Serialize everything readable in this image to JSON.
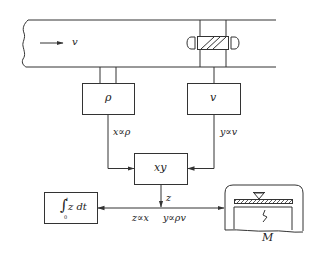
{
  "diagram": {
    "type": "block-diagram",
    "colors": {
      "line": "#333333",
      "background": "#ffffff"
    },
    "pipe": {
      "flow_label": "v"
    },
    "blocks": [
      {
        "id": "density",
        "label": "ρ"
      },
      {
        "id": "velocity",
        "label": "v"
      },
      {
        "id": "multiplier",
        "label": "xy"
      },
      {
        "id": "integrator",
        "label": "∫",
        "upper": "t",
        "lower": "0",
        "expr": "z dt"
      }
    ],
    "signals": {
      "density_out": "x∝ρ",
      "velocity_out": "y∝v",
      "product_out": "z",
      "relation_left": "z∝x",
      "relation_right": "y∝ρv"
    },
    "scale": {
      "label": "M"
    }
  }
}
